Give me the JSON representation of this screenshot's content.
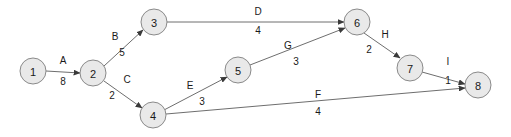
{
  "diagram": {
    "type": "directed-weighted-graph",
    "canvas": {
      "width": 511,
      "height": 137
    },
    "style": {
      "node_fill": "#e9e9e9",
      "node_stroke": "#8a8a8a",
      "edge_stroke": "#6e6e6e",
      "text_color": "#1a1a1a",
      "background": "#ffffff",
      "node_radius": 13
    },
    "nodes": [
      {
        "id": "1",
        "label": "1",
        "cx": 33,
        "cy": 71
      },
      {
        "id": "2",
        "label": "2",
        "cx": 93,
        "cy": 73
      },
      {
        "id": "3",
        "label": "3",
        "cx": 154,
        "cy": 22
      },
      {
        "id": "4",
        "label": "4",
        "cx": 153,
        "cy": 115
      },
      {
        "id": "5",
        "label": "5",
        "cx": 238,
        "cy": 70
      },
      {
        "id": "6",
        "label": "6",
        "cx": 357,
        "cy": 22
      },
      {
        "id": "7",
        "label": "7",
        "cx": 410,
        "cy": 68
      },
      {
        "id": "8",
        "label": "8",
        "cx": 478,
        "cy": 85
      }
    ],
    "edges": [
      {
        "id": "A",
        "name": "A",
        "weight": "8",
        "from": "1",
        "to": "2",
        "x1": 46,
        "y1": 71,
        "x2": 80,
        "y2": 73,
        "lx": 63,
        "ly": 64,
        "wx": 63,
        "wy": 85
      },
      {
        "id": "B",
        "name": "B",
        "weight": "5",
        "from": "2",
        "to": "3",
        "x1": 104,
        "y1": 66,
        "x2": 143,
        "y2": 30,
        "lx": 115,
        "ly": 40,
        "wx": 122,
        "wy": 56
      },
      {
        "id": "C",
        "name": "C",
        "weight": "2",
        "from": "2",
        "to": "4",
        "x1": 104,
        "y1": 81,
        "x2": 142,
        "y2": 108,
        "lx": 127,
        "ly": 83,
        "wx": 112,
        "wy": 99
      },
      {
        "id": "D",
        "name": "D",
        "weight": "4",
        "from": "3",
        "to": "6",
        "x1": 167,
        "y1": 22,
        "x2": 344,
        "y2": 22,
        "lx": 258,
        "ly": 15,
        "wx": 258,
        "wy": 34
      },
      {
        "id": "E",
        "name": "E",
        "weight": "3",
        "from": "4",
        "to": "5",
        "x1": 164,
        "y1": 110,
        "x2": 227,
        "y2": 77,
        "lx": 190,
        "ly": 89,
        "wx": 202,
        "wy": 105
      },
      {
        "id": "G",
        "name": "G",
        "weight": "3",
        "from": "5",
        "to": "6",
        "x1": 250,
        "y1": 65,
        "x2": 345,
        "y2": 28,
        "lx": 288,
        "ly": 49,
        "wx": 296,
        "wy": 65
      },
      {
        "id": "F",
        "name": "F",
        "weight": "4",
        "from": "4",
        "to": "8",
        "x1": 166,
        "y1": 114,
        "x2": 465,
        "y2": 88,
        "lx": 318,
        "ly": 98,
        "wx": 318,
        "wy": 115
      },
      {
        "id": "H",
        "name": "H",
        "weight": "2",
        "from": "6",
        "to": "7",
        "x1": 364,
        "y1": 33,
        "x2": 400,
        "y2": 58,
        "lx": 385,
        "ly": 38,
        "wx": 369,
        "wy": 53
      },
      {
        "id": "I",
        "name": "I",
        "weight": "1",
        "from": "7",
        "to": "8",
        "x1": 422,
        "y1": 72,
        "x2": 465,
        "y2": 84,
        "lx": 448,
        "ly": 65,
        "wx": 448,
        "wy": 84
      }
    ]
  }
}
